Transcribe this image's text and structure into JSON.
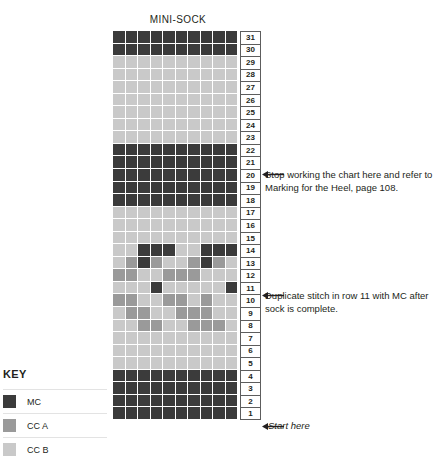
{
  "chart": {
    "title": "MINI-SOCK",
    "columns": 10,
    "rows": 31,
    "row_numbers": [
      31,
      30,
      29,
      28,
      27,
      26,
      25,
      24,
      23,
      22,
      21,
      20,
      19,
      18,
      17,
      16,
      15,
      14,
      13,
      12,
      11,
      10,
      9,
      8,
      7,
      6,
      5,
      4,
      3,
      2,
      1
    ]
  },
  "colors": {
    "mc": "#3b3b3b",
    "cc_a": "#9a9a9a",
    "cc_b": "#c9c9c9",
    "grid_line": "#ffffff",
    "rownum_border": "#5d5d5d",
    "text": "#231f20"
  },
  "key": {
    "title": "KEY",
    "items": [
      {
        "label": "MC",
        "color": "#3b3b3b",
        "code": "mc"
      },
      {
        "label": "CC A",
        "color": "#9a9a9a",
        "code": "cca"
      },
      {
        "label": "CC B",
        "color": "#c9c9c9",
        "code": "ccb"
      }
    ]
  },
  "annotations": {
    "stop_working": "Stop working the chart here and refer to Marking for the Heel, page 108.",
    "duplicate_stitch": "Duplicate stitch in row 11 with MC after sock is complete.",
    "start_here": "Start here",
    "stop_working_row": 21,
    "duplicate_stitch_row": 11,
    "start_here_row": 1
  },
  "chart_data": {
    "type": "heatmap",
    "title": "MINI-SOCK",
    "legend": [
      "MC",
      "CC A",
      "CC B"
    ],
    "palette": {
      "mc": "#3b3b3b",
      "cca": "#9a9a9a",
      "ccb": "#c9c9c9"
    },
    "row_labels": [
      31,
      30,
      29,
      28,
      27,
      26,
      25,
      24,
      23,
      22,
      21,
      20,
      19,
      18,
      17,
      16,
      15,
      14,
      13,
      12,
      11,
      10,
      9,
      8,
      7,
      6,
      5,
      4,
      3,
      2,
      1
    ],
    "columns": 10,
    "grid": [
      [
        "mc",
        "mc",
        "mc",
        "mc",
        "mc",
        "mc",
        "mc",
        "mc",
        "mc",
        "mc"
      ],
      [
        "mc",
        "mc",
        "mc",
        "mc",
        "mc",
        "mc",
        "mc",
        "mc",
        "mc",
        "mc"
      ],
      [
        "ccb",
        "ccb",
        "ccb",
        "ccb",
        "ccb",
        "ccb",
        "ccb",
        "ccb",
        "ccb",
        "ccb"
      ],
      [
        "ccb",
        "ccb",
        "ccb",
        "ccb",
        "ccb",
        "ccb",
        "ccb",
        "ccb",
        "ccb",
        "ccb"
      ],
      [
        "ccb",
        "ccb",
        "ccb",
        "ccb",
        "ccb",
        "ccb",
        "ccb",
        "ccb",
        "ccb",
        "ccb"
      ],
      [
        "ccb",
        "ccb",
        "ccb",
        "ccb",
        "ccb",
        "ccb",
        "ccb",
        "ccb",
        "ccb",
        "ccb"
      ],
      [
        "ccb",
        "ccb",
        "ccb",
        "ccb",
        "ccb",
        "ccb",
        "ccb",
        "ccb",
        "ccb",
        "ccb"
      ],
      [
        "ccb",
        "ccb",
        "ccb",
        "ccb",
        "ccb",
        "ccb",
        "ccb",
        "ccb",
        "ccb",
        "ccb"
      ],
      [
        "ccb",
        "ccb",
        "ccb",
        "ccb",
        "ccb",
        "ccb",
        "ccb",
        "ccb",
        "ccb",
        "ccb"
      ],
      [
        "mc",
        "mc",
        "mc",
        "mc",
        "mc",
        "mc",
        "mc",
        "mc",
        "mc",
        "mc"
      ],
      [
        "mc",
        "mc",
        "mc",
        "mc",
        "mc",
        "mc",
        "mc",
        "mc",
        "mc",
        "mc"
      ],
      [
        "mc",
        "mc",
        "mc",
        "mc",
        "mc",
        "mc",
        "mc",
        "mc",
        "mc",
        "mc"
      ],
      [
        "mc",
        "mc",
        "mc",
        "mc",
        "mc",
        "mc",
        "mc",
        "mc",
        "mc",
        "mc"
      ],
      [
        "mc",
        "mc",
        "mc",
        "mc",
        "mc",
        "mc",
        "mc",
        "mc",
        "mc",
        "mc"
      ],
      [
        "ccb",
        "ccb",
        "ccb",
        "ccb",
        "ccb",
        "ccb",
        "ccb",
        "ccb",
        "ccb",
        "ccb"
      ],
      [
        "ccb",
        "ccb",
        "ccb",
        "ccb",
        "ccb",
        "ccb",
        "ccb",
        "ccb",
        "ccb",
        "ccb"
      ],
      [
        "ccb",
        "ccb",
        "ccb",
        "ccb",
        "ccb",
        "ccb",
        "ccb",
        "ccb",
        "ccb",
        "ccb"
      ],
      [
        "ccb",
        "ccb",
        "mc",
        "mc",
        "mc",
        "ccb",
        "ccb",
        "mc",
        "mc",
        "mc"
      ],
      [
        "ccb",
        "cca",
        "mc",
        "cca",
        "ccb",
        "ccb",
        "cca",
        "mc",
        "cca",
        "ccb"
      ],
      [
        "cca",
        "cca",
        "ccb",
        "ccb",
        "cca",
        "cca",
        "cca",
        "ccb",
        "ccb",
        "ccb"
      ],
      [
        "ccb",
        "ccb",
        "ccb",
        "mc",
        "ccb",
        "ccb",
        "ccb",
        "ccb",
        "ccb",
        "mc"
      ],
      [
        "cca",
        "cca",
        "ccb",
        "ccb",
        "cca",
        "cca",
        "ccb",
        "cca",
        "ccb",
        "ccb"
      ],
      [
        "ccb",
        "cca",
        "cca",
        "ccb",
        "ccb",
        "cca",
        "cca",
        "cca",
        "ccb",
        "ccb"
      ],
      [
        "ccb",
        "ccb",
        "cca",
        "cca",
        "ccb",
        "ccb",
        "cca",
        "cca",
        "cca",
        "ccb"
      ],
      [
        "ccb",
        "ccb",
        "ccb",
        "ccb",
        "ccb",
        "ccb",
        "ccb",
        "ccb",
        "ccb",
        "ccb"
      ],
      [
        "ccb",
        "ccb",
        "ccb",
        "ccb",
        "ccb",
        "ccb",
        "ccb",
        "ccb",
        "ccb",
        "ccb"
      ],
      [
        "ccb",
        "ccb",
        "ccb",
        "ccb",
        "ccb",
        "ccb",
        "ccb",
        "ccb",
        "ccb",
        "ccb"
      ],
      [
        "mc",
        "mc",
        "mc",
        "mc",
        "mc",
        "mc",
        "mc",
        "mc",
        "mc",
        "mc"
      ],
      [
        "mc",
        "mc",
        "mc",
        "mc",
        "mc",
        "mc",
        "mc",
        "mc",
        "mc",
        "mc"
      ],
      [
        "mc",
        "mc",
        "mc",
        "mc",
        "mc",
        "mc",
        "mc",
        "mc",
        "mc",
        "mc"
      ],
      [
        "mc",
        "mc",
        "mc",
        "mc",
        "mc",
        "mc",
        "mc",
        "mc",
        "mc",
        "mc"
      ]
    ]
  }
}
